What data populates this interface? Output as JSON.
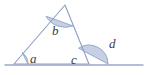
{
  "figure": {
    "type": "geometry-diagram",
    "colors": {
      "arc_fill": "#c3cce3",
      "arc_stroke": "#8fa3c8",
      "line_stroke": "#8d9fc6",
      "baseline_stroke": "#9aa8c9",
      "label_text": "#3c3c3c",
      "background": "#ffffff"
    },
    "baseline": {
      "name": "horizontal-base-line",
      "x1": 5,
      "y1": 65,
      "x2": 143,
      "y2": 65
    },
    "triangle": {
      "name": "triangle",
      "vertices": {
        "left": {
          "x": 14,
          "y": 64
        },
        "apex": {
          "x": 65,
          "y": 5
        },
        "right": {
          "x": 89,
          "y": 64
        }
      },
      "points": "14,64 65,5 89,64"
    },
    "angles": [
      {
        "id": "a",
        "label": "a",
        "name": "angle-a",
        "description": "interior angle at left base vertex",
        "vertex": {
          "x": 14,
          "y": 64
        },
        "label_pos": {
          "x": 30,
          "y": 63
        },
        "arc_radius": 14,
        "arc_path": "M 28,64 A 14,14 0 0 0 22.2,52.6 Z"
      },
      {
        "id": "b",
        "label": "b",
        "name": "angle-b",
        "description": "interior angle at apex",
        "vertex": {
          "x": 65,
          "y": 5
        },
        "label_pos": {
          "x": 52,
          "y": 35
        },
        "arc_radius": 22,
        "arc_path": "M 46.0,16.2 A 22,22 0 0 0 72.9,25.9 Z"
      },
      {
        "id": "c",
        "label": "c",
        "name": "angle-c",
        "description": "interior angle at right base vertex",
        "vertex": {
          "x": 89,
          "y": 64
        },
        "label_pos": {
          "x": 71,
          "y": 64
        },
        "arc_radius": 0,
        "arc_path": ""
      },
      {
        "id": "d",
        "label": "d",
        "name": "angle-d",
        "description": "exterior angle at right base vertex",
        "vertex": {
          "x": 89,
          "y": 64
        },
        "label_pos": {
          "x": 109,
          "y": 48
        },
        "arc_radius": 19,
        "arc_path": "M 108,64 A 19,19 0 0 0 78.6,48.2 Z"
      }
    ]
  }
}
